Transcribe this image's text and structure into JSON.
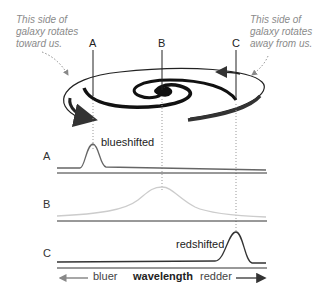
{
  "annotations": {
    "left_note": [
      "This side of",
      "galaxy rotates",
      "toward us."
    ],
    "right_note": [
      "This side of",
      "galaxy rotates",
      "away from us."
    ]
  },
  "galaxy_points": {
    "A": "A",
    "B": "B",
    "C": "C"
  },
  "spectra": [
    {
      "row": "A",
      "label": "blueshifted",
      "peak_x": 93,
      "color": "#666666"
    },
    {
      "row": "B",
      "label": "",
      "peak_x": 162,
      "color": "#cccccc"
    },
    {
      "row": "C",
      "label": "redshifted",
      "peak_x": 235,
      "color": "#333333"
    }
  ],
  "axis": {
    "left": "bluer",
    "center": "wavelength",
    "right": "redder"
  },
  "colors": {
    "ink": "#222222",
    "note": "#8a8a8a",
    "guide": "#999999"
  }
}
